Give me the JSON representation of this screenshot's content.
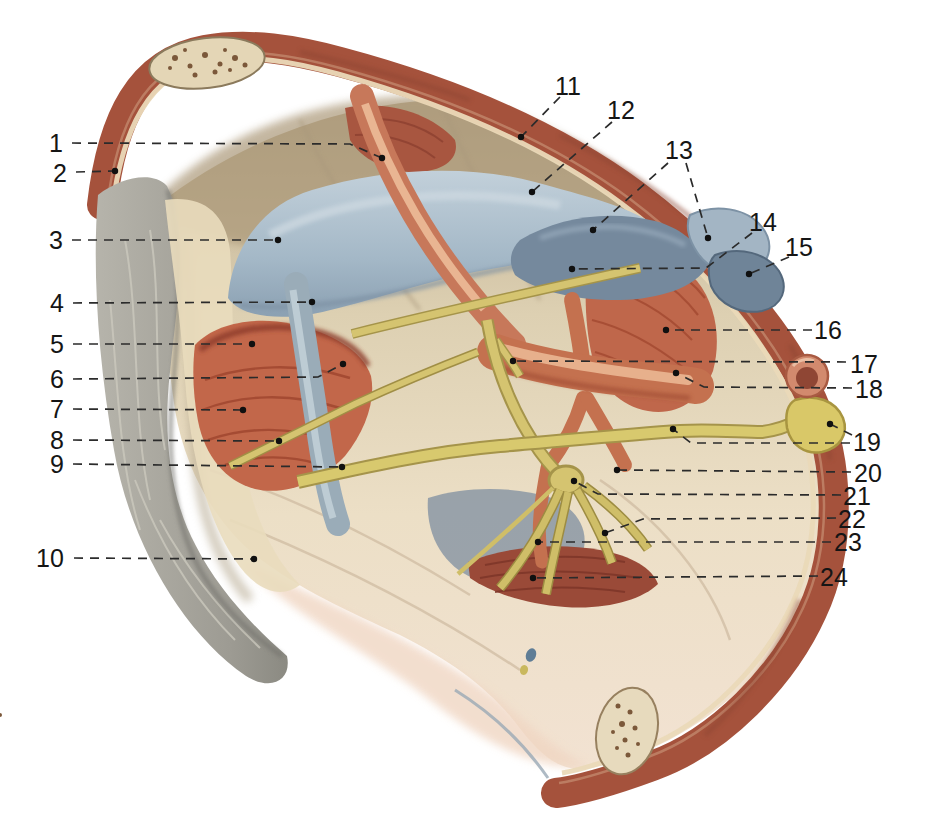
{
  "figure": {
    "kind": "anatomical-atlas-plate",
    "leader_style": {
      "dash": "9 7",
      "color": "#2b2b2b",
      "dot_radius": 3.2
    },
    "palette": {
      "background": "#ffffff",
      "wall_rim_red": "#a5523c",
      "rim_stratum_dark": "#8e4430",
      "rim_stratum_light": "#c08468",
      "bone_cream": "#e7dabd",
      "fascia_tan": "#bfae90",
      "peritoneum_grey": "#a3a199",
      "vein_blue": "#a9bcca",
      "deep_vein_blue": "#75899d",
      "artery_orange": "#c7785a",
      "muscle_red": "#c2674a",
      "deep_muscle_red": "#9a4a38",
      "nerve_yellow": "#d5c470",
      "ureter_grey_blue": "#9aacb8",
      "label_color": "#151515"
    },
    "labels": [
      {
        "n": "1",
        "tx": 56,
        "ty": 143,
        "lines": [
          [
            [
              72,
              143
            ],
            [
              350,
              144
            ],
            [
              382,
              158
            ]
          ]
        ],
        "dots": [
          [
            382,
            158
          ]
        ]
      },
      {
        "n": "2",
        "tx": 60,
        "ty": 173,
        "lines": [
          [
            [
              76,
              172
            ],
            [
              115,
              171
            ]
          ]
        ],
        "dots": [
          [
            115,
            171
          ]
        ]
      },
      {
        "n": "3",
        "tx": 56,
        "ty": 240,
        "lines": [
          [
            [
              72,
              240
            ],
            [
              278,
              240
            ]
          ]
        ],
        "dots": [
          [
            278,
            240
          ]
        ]
      },
      {
        "n": "4",
        "tx": 57,
        "ty": 303,
        "lines": [
          [
            [
              73,
              303
            ],
            [
              312,
              302
            ]
          ]
        ],
        "dots": [
          [
            312,
            302
          ]
        ]
      },
      {
        "n": "5",
        "tx": 57,
        "ty": 344,
        "lines": [
          [
            [
              73,
              344
            ],
            [
              252,
              344
            ]
          ]
        ],
        "dots": [
          [
            252,
            344
          ]
        ]
      },
      {
        "n": "6",
        "tx": 57,
        "ty": 379,
        "lines": [
          [
            [
              73,
              379
            ],
            [
              318,
              377
            ],
            [
              343,
              364
            ]
          ]
        ],
        "dots": [
          [
            343,
            364
          ]
        ]
      },
      {
        "n": "7",
        "tx": 57,
        "ty": 409,
        "lines": [
          [
            [
              73,
              409
            ],
            [
              243,
              410
            ]
          ]
        ],
        "dots": [
          [
            243,
            410
          ]
        ]
      },
      {
        "n": "8",
        "tx": 57,
        "ty": 440,
        "lines": [
          [
            [
              73,
              440
            ],
            [
              279,
              441
            ]
          ]
        ],
        "dots": [
          [
            279,
            441
          ]
        ]
      },
      {
        "n": "9",
        "tx": 57,
        "ty": 464,
        "lines": [
          [
            [
              73,
              464
            ],
            [
              342,
              467
            ]
          ]
        ],
        "dots": [
          [
            342,
            467
          ]
        ]
      },
      {
        "n": "10",
        "tx": 50,
        "ty": 558,
        "lines": [
          [
            [
              74,
              558
            ],
            [
              254,
              559
            ]
          ]
        ],
        "dots": [
          [
            254,
            559
          ]
        ]
      },
      {
        "n": "11",
        "tx": 568,
        "ty": 86,
        "lines": [
          [
            [
              560,
              97
            ],
            [
              521,
              137
            ]
          ]
        ],
        "dots": [
          [
            521,
            137
          ]
        ]
      },
      {
        "n": "12",
        "tx": 621,
        "ty": 110,
        "lines": [
          [
            [
              612,
              122
            ],
            [
              532,
              192
            ]
          ]
        ],
        "dots": [
          [
            532,
            192
          ]
        ]
      },
      {
        "n": "13",
        "tx": 679,
        "ty": 150,
        "lines": [
          [
            [
              668,
              163
            ],
            [
              593,
              230
            ]
          ],
          [
            [
              686,
              163
            ],
            [
              708,
              238
            ]
          ]
        ],
        "dots": [
          [
            593,
            230
          ],
          [
            708,
            238
          ]
        ]
      },
      {
        "n": "14",
        "tx": 763,
        "ty": 222,
        "lines": [
          [
            [
              752,
              233
            ],
            [
              706,
              268
            ],
            [
              572,
              269
            ]
          ]
        ],
        "dots": [
          [
            572,
            269
          ]
        ]
      },
      {
        "n": "15",
        "tx": 799,
        "ty": 247,
        "lines": [
          [
            [
              789,
              257
            ],
            [
              749,
              274
            ]
          ]
        ],
        "dots": [
          [
            749,
            274
          ]
        ]
      },
      {
        "n": "16",
        "tx": 828,
        "ty": 330,
        "lines": [
          [
            [
              812,
              330
            ],
            [
              666,
              330
            ]
          ]
        ],
        "dots": [
          [
            666,
            330
          ]
        ]
      },
      {
        "n": "17",
        "tx": 864,
        "ty": 364,
        "lines": [
          [
            [
              846,
              362
            ],
            [
              513,
              361
            ]
          ]
        ],
        "dots": [
          [
            513,
            361
          ]
        ]
      },
      {
        "n": "18",
        "tx": 869,
        "ty": 389,
        "lines": [
          [
            [
              852,
              388
            ],
            [
              704,
              387
            ],
            [
              676,
              373
            ]
          ]
        ],
        "dots": [
          [
            676,
            373
          ]
        ]
      },
      {
        "n": "19",
        "tx": 867,
        "ty": 442,
        "lines": [
          [
            [
              852,
              435
            ],
            [
              830,
              424
            ]
          ],
          [
            [
              850,
              443
            ],
            [
              691,
              443
            ],
            [
              673,
              429
            ]
          ]
        ],
        "dots": [
          [
            830,
            424
          ],
          [
            673,
            429
          ]
        ]
      },
      {
        "n": "20",
        "tx": 868,
        "ty": 473,
        "lines": [
          [
            [
              851,
              472
            ],
            [
              617,
              470
            ]
          ]
        ],
        "dots": [
          [
            617,
            470
          ]
        ]
      },
      {
        "n": "21",
        "tx": 857,
        "ty": 496,
        "lines": [
          [
            [
              841,
              495
            ],
            [
              598,
              494
            ],
            [
              574,
              481
            ]
          ]
        ],
        "dots": [
          [
            574,
            481
          ]
        ]
      },
      {
        "n": "22",
        "tx": 852,
        "ty": 519,
        "lines": [
          [
            [
              836,
              518
            ],
            [
              643,
              519
            ],
            [
              605,
              533
            ]
          ]
        ],
        "dots": [
          [
            605,
            533
          ]
        ]
      },
      {
        "n": "23",
        "tx": 848,
        "ty": 542,
        "lines": [
          [
            [
              831,
              542
            ],
            [
              538,
              542
            ]
          ]
        ],
        "dots": [
          [
            538,
            542
          ]
        ]
      },
      {
        "n": "24",
        "tx": 834,
        "ty": 577,
        "lines": [
          [
            [
              818,
              576
            ],
            [
              533,
              578
            ]
          ]
        ],
        "dots": [
          [
            533,
            578
          ]
        ]
      }
    ]
  }
}
